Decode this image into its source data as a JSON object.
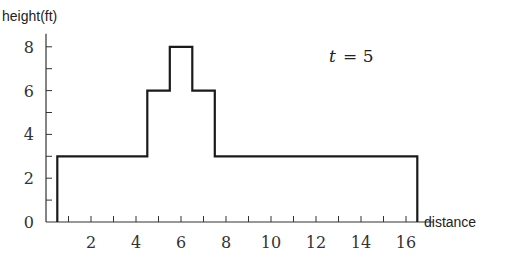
{
  "chart_data": {
    "type": "line",
    "subtype": "step",
    "title": "",
    "annotation": "t = 5",
    "xlabel": "distance",
    "ylabel": "height(ft)",
    "xlim": [
      0,
      17
    ],
    "ylim": [
      0,
      8.5
    ],
    "x_ticks_major": [
      2,
      4,
      6,
      8,
      10,
      12,
      14,
      16
    ],
    "x_ticks_minor": [
      1,
      3,
      5,
      7,
      9,
      11,
      13,
      15
    ],
    "y_ticks_major": [
      0,
      2,
      4,
      6,
      8
    ],
    "y_ticks_minor": [
      1,
      3,
      5,
      7
    ],
    "grid": false,
    "legend": null,
    "series": [
      {
        "name": "height profile",
        "x": [
          0.5,
          0.5,
          4.5,
          4.5,
          5.5,
          5.5,
          6.5,
          6.5,
          7.5,
          7.5,
          16.5,
          16.5
        ],
        "y": [
          0,
          3,
          3,
          6,
          6,
          8,
          8,
          6,
          6,
          3,
          3,
          0
        ]
      }
    ]
  },
  "labels": {
    "ylabel": "height(ft)",
    "xlabel": "distance",
    "annotation_var": "t",
    "annotation_eq": "= 5"
  }
}
